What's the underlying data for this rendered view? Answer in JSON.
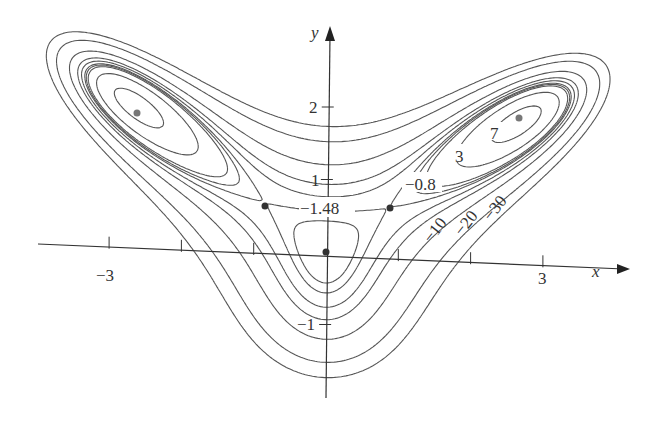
{
  "chart_data": {
    "type": "contour",
    "title": "",
    "function": "f(x,y) = 10x^2 y - 5x^2 - 4y^2 - x^4 - 2y^4",
    "xlabel": "x",
    "ylabel": "y",
    "x_ticks": [
      -3,
      -2,
      -1,
      0,
      1,
      2,
      3
    ],
    "x_tick_labels": [
      "-3",
      "3"
    ],
    "y_ticks": [
      -1,
      1,
      2
    ],
    "y_tick_labels": [
      "-1",
      "1",
      "2"
    ],
    "xlim": [
      -4,
      4.3
    ],
    "ylim": [
      -2,
      3.3
    ],
    "levels": [
      -30,
      -20,
      -10,
      -5,
      -3,
      -1.48,
      -0.8,
      0,
      3,
      7
    ],
    "level_labels": [
      "7",
      "3",
      "-0.8",
      "-1.48",
      "-10",
      "-20",
      "-30"
    ],
    "critical_points": [
      {
        "x": 0,
        "y": 0,
        "type": "local max",
        "value": 0
      },
      {
        "x": -0.86,
        "y": 0.65,
        "type": "saddle",
        "value": -1.48
      },
      {
        "x": 0.86,
        "y": 0.65,
        "type": "saddle",
        "value": -1.48
      },
      {
        "x": -2.64,
        "y": 1.9,
        "type": "local max",
        "value": 8.5
      },
      {
        "x": 2.64,
        "y": 1.9,
        "type": "local max",
        "value": 8.5
      }
    ],
    "grid": false,
    "legend": "none"
  },
  "axes": {
    "x_label": "x",
    "y_label": "y"
  },
  "labels": {
    "x_neg3": "−3",
    "x_3": "3",
    "y_1": "1",
    "y_2": "2",
    "y_neg1": "−1",
    "l7": "7",
    "l3": "3",
    "l08": "−0.8",
    "l148": "−1.48",
    "l10": "−10",
    "l20": "−20",
    "l30": "−30"
  },
  "colors": {
    "line": "#555555",
    "point": "#666666",
    "axis": "#333333"
  }
}
